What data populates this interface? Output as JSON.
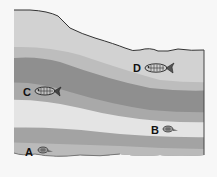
{
  "diagram": {
    "colors": {
      "background": "#f7f7f7",
      "layer_top": "#d2d2d2",
      "layer_2": "#bdbdbd",
      "layer_dark": "#8f8f8f",
      "layer_4": "#a9a9a9",
      "layer_light": "#e4e4e4",
      "layer_6": "#a3a3a3",
      "layer_bottom": "#bababa",
      "outline": "#333333"
    },
    "fossils": [
      {
        "id": "A",
        "label": "A",
        "type": "small-shell",
        "layer": "bottom"
      },
      {
        "id": "B",
        "label": "B",
        "type": "small-shell",
        "layer": "light"
      },
      {
        "id": "C",
        "label": "C",
        "type": "fish",
        "layer": "dark-lower"
      },
      {
        "id": "D",
        "label": "D",
        "type": "fish",
        "layer": "top"
      }
    ]
  }
}
